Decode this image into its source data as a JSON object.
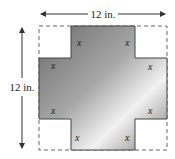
{
  "diagram": {
    "width_label": "12 in.",
    "height_label": "12 in.",
    "cut_label": "x",
    "cut_labels": [
      "x",
      "x",
      "x",
      "x",
      "x",
      "x",
      "x",
      "x"
    ],
    "colors": {
      "outline": "#555555",
      "dashed": "#666666",
      "shade_dark": "#6e6e6e",
      "shade_light": "#f4f4f4"
    }
  }
}
